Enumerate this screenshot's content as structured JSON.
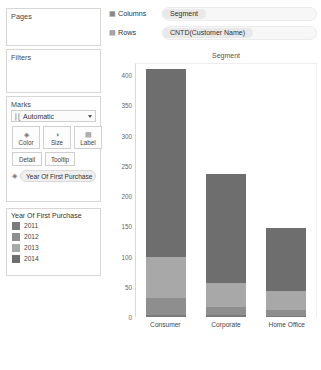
{
  "left_panel": {
    "pages": {
      "title": "Pages"
    },
    "filters": {
      "title": "Filters"
    },
    "marks": {
      "title": "Marks",
      "mark_type": "Automatic",
      "mark_type_icon": "bar-chart-icon",
      "buttons": [
        {
          "label": "Color",
          "icon": "color-palette-icon"
        },
        {
          "label": "Size",
          "icon": "size-circle-icon"
        },
        {
          "label": "Label",
          "icon": "abc-label-icon"
        },
        {
          "label": "Detail",
          "icon": "detail-icon"
        },
        {
          "label": "Tooltip",
          "icon": "tooltip-icon"
        }
      ],
      "pill": {
        "label": "Year Of First Purchase",
        "icon": "color-palette-icon"
      }
    },
    "legend": {
      "title": "Year Of First Purchase",
      "items": [
        {
          "label": "2011",
          "color": "#7a7a7a"
        },
        {
          "label": "2012",
          "color": "#8e8e8e"
        },
        {
          "label": "2013",
          "color": "#a8a8a8"
        },
        {
          "label": "2014",
          "color": "#6e6e6e"
        }
      ]
    }
  },
  "shelves": [
    {
      "name": "Columns",
      "icon": "columns-icon",
      "field": "Segment"
    },
    {
      "name": "Rows",
      "icon": "rows-icon",
      "field": "CNTD(Customer Name)"
    }
  ],
  "chart_data": {
    "type": "bar",
    "title": "Segment",
    "xlabel": "",
    "ylabel": "Distinct count of Customer Name",
    "categories": [
      "Consumer",
      "Corporate",
      "Home Office"
    ],
    "ylim": [
      0,
      420
    ],
    "yticks": [
      0,
      50,
      100,
      150,
      200,
      250,
      300,
      350,
      400
    ],
    "grid": false,
    "stacked": true,
    "legend_position": "left-panel",
    "series": [
      {
        "name": "2011",
        "color": "#7a7a7a",
        "values": [
          4,
          3,
          2
        ]
      },
      {
        "name": "2012",
        "color": "#8e8e8e",
        "values": [
          28,
          13,
          10
        ]
      },
      {
        "name": "2013",
        "color": "#a8a8a8",
        "values": [
          68,
          41,
          31
        ]
      },
      {
        "name": "2014",
        "color": "#6e6e6e",
        "values": [
          310,
          180,
          105
        ]
      }
    ],
    "totals": [
      410,
      237,
      148
    ]
  }
}
